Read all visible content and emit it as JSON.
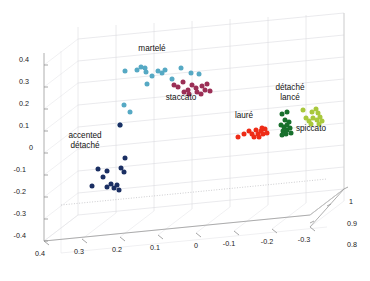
{
  "figure": {
    "background": "#ffffff",
    "width": 370,
    "height": 281
  },
  "chart_data": {
    "type": "scatter",
    "title": "",
    "subtitle": "",
    "projection": "3d",
    "xlabel": "",
    "ylabel": "",
    "zlabel": "",
    "grid": true,
    "legend_position": "inline-annotations",
    "xlim": [
      -0.35,
      0.45
    ],
    "ylim": [
      -0.45,
      0.45
    ],
    "zlim": [
      0.75,
      1.02
    ],
    "xticks": [
      "0.4",
      "0.3",
      "0.2",
      "0.1",
      "0",
      "-0.1",
      "-0.2",
      "-0.3"
    ],
    "xtick_values": [
      0.4,
      0.3,
      0.2,
      0.1,
      0,
      -0.1,
      -0.2,
      -0.3
    ],
    "yticks": [
      "0.4",
      "0.3",
      "0.2",
      "0.1",
      "0",
      "-0.1",
      "-0.2",
      "-0.3",
      "-0.4"
    ],
    "ytick_values": [
      0.4,
      0.3,
      0.2,
      0.1,
      0,
      -0.1,
      -0.2,
      -0.3,
      -0.4
    ],
    "zticks": [
      "1",
      "0.9",
      "0.8"
    ],
    "ztick_values": [
      1,
      0.9,
      0.8
    ],
    "series": [
      {
        "name": "martelé",
        "label": "martelé",
        "color": "#56a9c4",
        "label_px": {
          "x": 152,
          "y": 51
        },
        "points_px": [
          {
            "x": 125,
            "y": 71
          },
          {
            "x": 137,
            "y": 70
          },
          {
            "x": 141,
            "y": 67
          },
          {
            "x": 145,
            "y": 68
          },
          {
            "x": 146,
            "y": 72
          },
          {
            "x": 152,
            "y": 76
          },
          {
            "x": 158,
            "y": 71
          },
          {
            "x": 162,
            "y": 73
          },
          {
            "x": 165,
            "y": 70
          },
          {
            "x": 147,
            "y": 84
          },
          {
            "x": 172,
            "y": 79
          },
          {
            "x": 181,
            "y": 68
          },
          {
            "x": 124,
            "y": 105
          },
          {
            "x": 130,
            "y": 112
          },
          {
            "x": 120,
            "y": 125
          },
          {
            "x": 191,
            "y": 73
          },
          {
            "x": 199,
            "y": 74
          }
        ]
      },
      {
        "name": "staccato",
        "label": "staccato",
        "color": "#9b2f56",
        "label_px": {
          "x": 181,
          "y": 100
        },
        "points_px": [
          {
            "x": 174,
            "y": 85
          },
          {
            "x": 178,
            "y": 87
          },
          {
            "x": 183,
            "y": 82
          },
          {
            "x": 188,
            "y": 90
          },
          {
            "x": 192,
            "y": 85
          },
          {
            "x": 196,
            "y": 88
          },
          {
            "x": 197,
            "y": 92
          },
          {
            "x": 202,
            "y": 86
          },
          {
            "x": 205,
            "y": 90
          },
          {
            "x": 207,
            "y": 84
          },
          {
            "x": 210,
            "y": 91
          },
          {
            "x": 184,
            "y": 92
          },
          {
            "x": 189,
            "y": 94
          },
          {
            "x": 201,
            "y": 94
          }
        ]
      },
      {
        "name": "accented détaché",
        "label_line1": "accented",
        "label_line2": "détaché",
        "color": "#1b2f63",
        "label_px": {
          "x": 85,
          "y": 138
        },
        "points_px": [
          {
            "x": 120,
            "y": 125
          },
          {
            "x": 125,
            "y": 158
          },
          {
            "x": 98,
            "y": 169
          },
          {
            "x": 107,
            "y": 171
          },
          {
            "x": 103,
            "y": 177
          },
          {
            "x": 121,
            "y": 168
          },
          {
            "x": 124,
            "y": 172
          },
          {
            "x": 111,
            "y": 184
          },
          {
            "x": 92,
            "y": 186
          },
          {
            "x": 107,
            "y": 187
          },
          {
            "x": 114,
            "y": 188
          },
          {
            "x": 117,
            "y": 185
          },
          {
            "x": 119,
            "y": 190
          }
        ]
      },
      {
        "name": "lauré",
        "label": "lauré",
        "color": "#ee2b16",
        "label_px": {
          "x": 244,
          "y": 118
        },
        "points_px": [
          {
            "x": 238,
            "y": 137
          },
          {
            "x": 244,
            "y": 134
          },
          {
            "x": 249,
            "y": 131
          },
          {
            "x": 252,
            "y": 134
          },
          {
            "x": 256,
            "y": 130
          },
          {
            "x": 258,
            "y": 134
          },
          {
            "x": 261,
            "y": 131
          },
          {
            "x": 263,
            "y": 134
          },
          {
            "x": 265,
            "y": 129
          },
          {
            "x": 267,
            "y": 133
          },
          {
            "x": 259,
            "y": 137
          },
          {
            "x": 254,
            "y": 137
          },
          {
            "x": 262,
            "y": 128
          }
        ]
      },
      {
        "name": "détaché lancé",
        "label_line1": "détaché",
        "label_line2": "lancé",
        "color": "#18702c",
        "label_px": {
          "x": 290,
          "y": 90
        },
        "points_px": [
          {
            "x": 282,
            "y": 114
          },
          {
            "x": 287,
            "y": 112
          },
          {
            "x": 285,
            "y": 120
          },
          {
            "x": 281,
            "y": 125
          },
          {
            "x": 284,
            "y": 127
          },
          {
            "x": 287,
            "y": 125
          },
          {
            "x": 283,
            "y": 131
          },
          {
            "x": 287,
            "y": 130
          },
          {
            "x": 290,
            "y": 128
          },
          {
            "x": 291,
            "y": 133
          },
          {
            "x": 286,
            "y": 134
          },
          {
            "x": 282,
            "y": 135
          },
          {
            "x": 289,
            "y": 122
          }
        ]
      },
      {
        "name": "spiccato",
        "label": "spiccato",
        "color": "#a8c83c",
        "label_px": {
          "x": 311,
          "y": 131
        },
        "points_px": [
          {
            "x": 303,
            "y": 110
          },
          {
            "x": 312,
            "y": 112
          },
          {
            "x": 316,
            "y": 109
          },
          {
            "x": 318,
            "y": 113
          },
          {
            "x": 306,
            "y": 118
          },
          {
            "x": 309,
            "y": 121
          },
          {
            "x": 313,
            "y": 118
          },
          {
            "x": 317,
            "y": 120
          },
          {
            "x": 320,
            "y": 117
          },
          {
            "x": 322,
            "y": 121
          },
          {
            "x": 311,
            "y": 124
          },
          {
            "x": 319,
            "y": 124
          }
        ]
      }
    ]
  },
  "axes": {
    "x_tick_labels": [
      {
        "text": "0.4",
        "x": 40,
        "y": 256
      },
      {
        "text": "0.3",
        "x": 79,
        "y": 254
      },
      {
        "text": "0.2",
        "x": 117,
        "y": 252
      },
      {
        "text": "0.1",
        "x": 155,
        "y": 250
      },
      {
        "text": "0",
        "x": 196,
        "y": 248
      },
      {
        "text": "-0.1",
        "x": 229,
        "y": 246
      },
      {
        "text": "-0.2",
        "x": 267,
        "y": 244
      },
      {
        "text": "-0.3",
        "x": 304,
        "y": 242
      }
    ],
    "y_tick_labels": [
      {
        "text": "0.4",
        "x": 29,
        "y": 62
      },
      {
        "text": "0.3",
        "x": 29,
        "y": 84
      },
      {
        "text": "0.2",
        "x": 29,
        "y": 106
      },
      {
        "text": "0.1",
        "x": 29,
        "y": 128
      },
      {
        "text": "0",
        "x": 33,
        "y": 150
      },
      {
        "text": "-0.1",
        "x": 26,
        "y": 172
      },
      {
        "text": "-0.2",
        "x": 26,
        "y": 194
      },
      {
        "text": "-0.3",
        "x": 26,
        "y": 216
      },
      {
        "text": "-0.4",
        "x": 26,
        "y": 238
      }
    ],
    "z_tick_labels": [
      {
        "text": "1",
        "x": 349,
        "y": 204
      },
      {
        "text": "0.9",
        "x": 347,
        "y": 226
      },
      {
        "text": "0.8",
        "x": 347,
        "y": 247
      }
    ]
  }
}
